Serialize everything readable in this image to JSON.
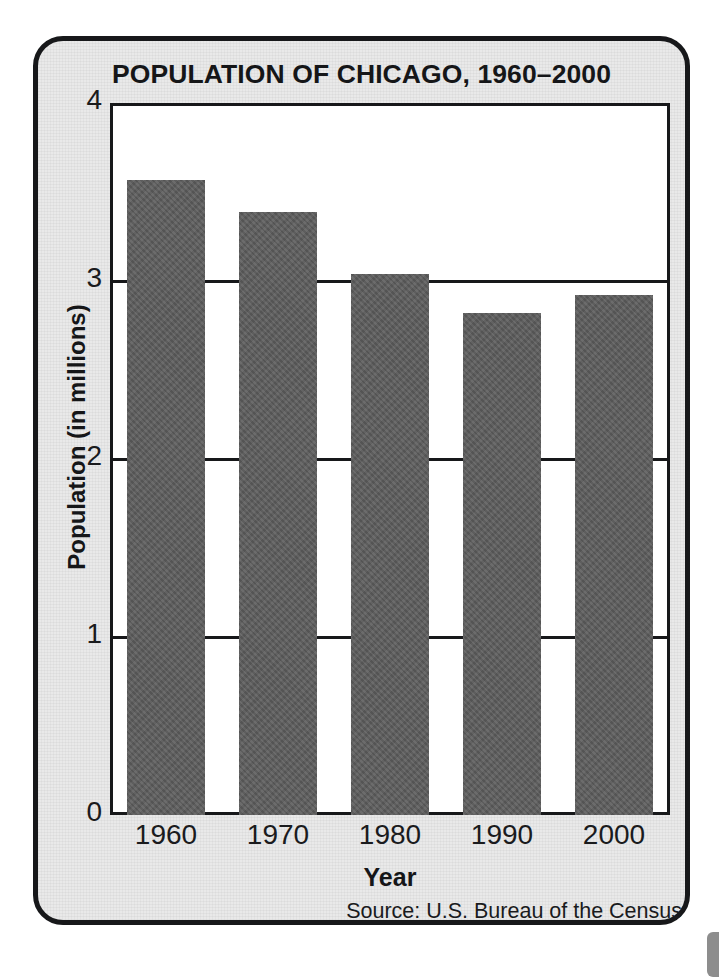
{
  "card": {
    "title": "POPULATION OF CHICAGO, 1960–2000",
    "background_color": "#e9e9e9",
    "border_color": "#17181a"
  },
  "chart_data": {
    "type": "bar",
    "title": "POPULATION OF CHICAGO, 1960–2000",
    "subtitle": "",
    "categories": [
      "1960",
      "1970",
      "1980",
      "1990",
      "2000"
    ],
    "values": [
      3.57,
      3.39,
      3.04,
      2.82,
      2.92
    ],
    "xlabel": "Year",
    "ylabel": "Population (in millions)",
    "ylim": [
      0,
      4
    ],
    "yticks": [
      "0",
      "1",
      "2",
      "3",
      "4"
    ],
    "ytick_values": [
      0,
      1,
      2,
      3,
      4
    ],
    "gridlines": [
      1,
      2,
      3
    ],
    "grid": true,
    "legend": false,
    "bar_color": "#5d5d5d",
    "axis_color": "#17181a",
    "plot_background": "#ffffff",
    "annotations": [
      "Source: U.S. Bureau of the Census"
    ]
  },
  "source_note": "Source: U.S. Bureau of the Census",
  "page": {
    "bottom_cropped_text": "",
    "edge_mark": ""
  }
}
